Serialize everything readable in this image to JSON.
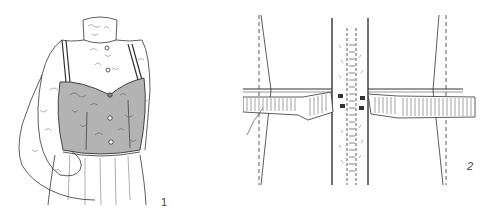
{
  "figures": [
    {
      "id": "1",
      "label": "1",
      "subject": "lace blouse with gray camisole bodice over gathered skirt",
      "colors": {
        "line": "#333333",
        "bodice": "#b3b3b3",
        "lace": "#555555"
      }
    },
    {
      "id": "2",
      "label": "2",
      "subject": "waistband construction detail at zipper with hook closures",
      "colors": {
        "line": "#333333",
        "stitch": "#555555"
      }
    }
  ]
}
